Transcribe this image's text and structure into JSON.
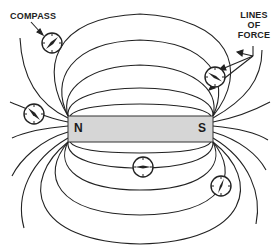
{
  "diagram": {
    "labels": {
      "compass": "COMPASS",
      "lines_of_force_1": "LINES",
      "lines_of_force_2": "OF",
      "lines_of_force_3": "FORCE"
    },
    "magnet": {
      "north_label": "N",
      "south_label": "S",
      "fill_color": "#d6d6d6",
      "stroke_color": "#333333"
    },
    "compasses": [
      {
        "id": "compass-top-left",
        "cx": 52,
        "cy": 43,
        "needle_angle": -50
      },
      {
        "id": "compass-top-right",
        "cx": 215,
        "cy": 77,
        "needle_angle": 35
      },
      {
        "id": "compass-left",
        "cx": 34,
        "cy": 114,
        "needle_angle": 40
      },
      {
        "id": "compass-bottom-center",
        "cx": 143,
        "cy": 167,
        "needle_angle": 0
      },
      {
        "id": "compass-bottom-right",
        "cx": 221,
        "cy": 186,
        "needle_angle": -65
      }
    ],
    "line_color": "#222222",
    "background_color": "#ffffff"
  }
}
